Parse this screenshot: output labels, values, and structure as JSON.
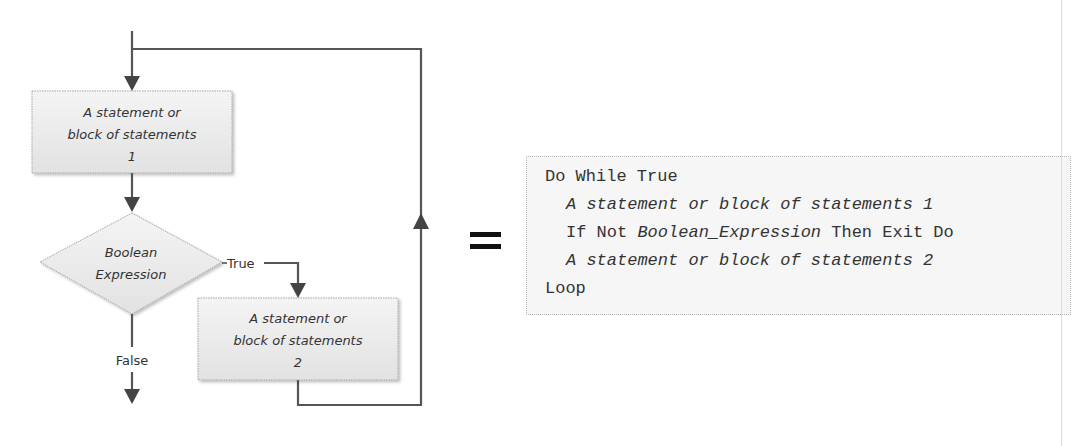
{
  "flowchart": {
    "box1": {
      "line1": "A statement or",
      "line2": "block of statements",
      "line3": "1"
    },
    "decision": {
      "line1": "Boolean",
      "line2": "Expression"
    },
    "true_label": "True",
    "false_label": "False",
    "box2": {
      "line1": "A statement or",
      "line2": "block of statements",
      "line3": "2"
    },
    "colors": {
      "line": "#555555",
      "box_fill": "#ececec",
      "box_border": "#a0a0a0",
      "text": "#333333"
    }
  },
  "equals_symbol": "=",
  "code": {
    "lines": [
      {
        "parts": [
          {
            "text": "Do While True",
            "italic": false
          }
        ]
      },
      {
        "parts": [
          {
            "text": "A statement or block of statements 1",
            "italic": true
          }
        ]
      },
      {
        "parts": [
          {
            "text": "If Not ",
            "italic": false
          },
          {
            "text": "Boolean_Expression",
            "italic": true
          },
          {
            "text": " Then Exit Do",
            "italic": false
          }
        ]
      },
      {
        "parts": [
          {
            "text": "A statement or block of statements 2",
            "italic": true
          }
        ]
      },
      {
        "parts": [
          {
            "text": "Loop",
            "italic": false
          }
        ]
      }
    ]
  }
}
